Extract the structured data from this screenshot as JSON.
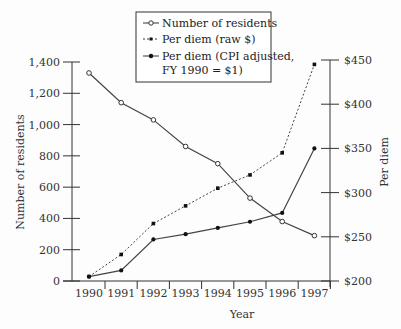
{
  "chart_data": {
    "type": "line",
    "title": "",
    "x": [
      1990,
      1991,
      1992,
      1993,
      1994,
      1995,
      1996,
      1997
    ],
    "xlabel": "Year",
    "ylabel": "Number of residents",
    "ylabel_right": "Per diem",
    "ylim": [
      0,
      1400
    ],
    "ylim_right": [
      200,
      450
    ],
    "yticks": [
      0,
      200,
      400,
      600,
      800,
      1000,
      1200,
      1400
    ],
    "yticks_labels": [
      "0",
      "200",
      "400",
      "600",
      "800",
      "1,000",
      "1,200",
      "1,400"
    ],
    "yticks_right": [
      200,
      250,
      300,
      350,
      400,
      450
    ],
    "yticks_right_labels": [
      "$200",
      "$250",
      "$300",
      "$350",
      "$400",
      "$450"
    ],
    "grid": false,
    "legend_position": "top-center",
    "series": [
      {
        "name": "Number of residents",
        "axis": "left",
        "marker": "open-circle",
        "line": "solid",
        "values": [
          1330,
          1140,
          1030,
          860,
          750,
          530,
          380,
          290
        ]
      },
      {
        "name": "Per diem (raw $)",
        "axis": "right",
        "marker": "filled-square",
        "line": "dashed",
        "values": [
          205,
          230,
          265,
          285,
          305,
          320,
          345,
          445
        ]
      },
      {
        "name": "Per diem (CPI adjusted, FY 1990 = $1)",
        "axis": "right",
        "marker": "filled-circle",
        "line": "solid",
        "values": [
          205,
          212,
          247,
          253,
          260,
          267,
          277,
          350
        ]
      }
    ]
  },
  "legend": {
    "items": [
      {
        "line1": "Number of residents",
        "line2": ""
      },
      {
        "line1": "Per diem (raw $)",
        "line2": ""
      },
      {
        "line1": "Per diem (CPI adjusted,",
        "line2": "FY 1990 = $1)"
      }
    ]
  },
  "axes": {
    "x_title": "Year",
    "y_left_title": "Number of residents",
    "y_right_title": "Per diem"
  }
}
